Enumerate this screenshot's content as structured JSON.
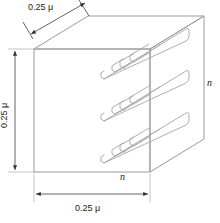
{
  "figure": {
    "colors": {
      "line": "#9a9a9a",
      "dim_line": "#4a4a4a",
      "text": "#1a1a1a",
      "background": "#ffffff"
    },
    "labels": {
      "depth_dimension": "0.25 μ",
      "height_dimension": "0.25 μ",
      "width_dimension": "0.25 μ",
      "n_bottom": "n",
      "n_right": "n"
    },
    "icons": {
      "arrow_depth": "double-arrow-diagonal-icon",
      "arrow_height": "double-arrow-vertical-icon",
      "arrow_width": "double-arrow-horizontal-icon"
    },
    "geometry": {
      "front_face": {
        "top_left": [
          34,
          49
        ],
        "top_right": [
          150,
          49
        ],
        "bottom_right": [
          150,
          172
        ],
        "bottom_left": [
          34,
          172
        ]
      },
      "back_offset": [
        54,
        -33
      ],
      "serpentine_rows": 3
    }
  }
}
